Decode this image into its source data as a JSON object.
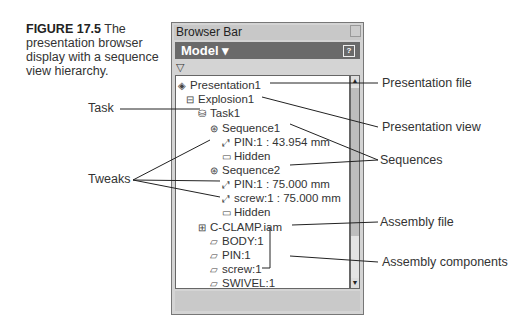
{
  "caption": {
    "figure": "FIGURE 17.5",
    "text": "The presentation browser display with a sequence view hierarchy."
  },
  "panel": {
    "title": "Browser Bar",
    "model_label": "Model ▾",
    "help_icon": "?",
    "filter_icon": "▽",
    "tree": [
      {
        "label": "Presentation1",
        "level": 0,
        "icon": "presentation-icon"
      },
      {
        "label": "Explosion1",
        "level": 1,
        "icon": "explosion-icon"
      },
      {
        "label": "Task1",
        "level": 2,
        "icon": "task-icon"
      },
      {
        "label": "Sequence1",
        "level": 3,
        "icon": "sequence-icon"
      },
      {
        "label": "PIN:1 : 43.954 mm",
        "level": 4,
        "icon": "tweak-icon"
      },
      {
        "label": "Hidden",
        "level": 4,
        "icon": "folder-icon"
      },
      {
        "label": "Sequence2",
        "level": 3,
        "icon": "sequence-icon"
      },
      {
        "label": "PIN:1 : 75.000 mm",
        "level": 4,
        "icon": "tweak-icon"
      },
      {
        "label": "screw:1 : 75.000 mm",
        "level": 4,
        "icon": "tweak-icon"
      },
      {
        "label": "Hidden",
        "level": 4,
        "icon": "folder-icon"
      },
      {
        "label": "C-CLAMP.iam",
        "level": 2,
        "icon": "assembly-icon"
      },
      {
        "label": "BODY:1",
        "level": 3,
        "icon": "part-icon"
      },
      {
        "label": "PIN:1",
        "level": 3,
        "icon": "part-icon"
      },
      {
        "label": "screw:1",
        "level": 3,
        "icon": "part-icon"
      },
      {
        "label": "SWIVEL:1",
        "level": 3,
        "icon": "part-icon"
      }
    ]
  },
  "callouts": {
    "task": "Task",
    "tweaks": "Tweaks",
    "presentation_file": "Presentation file",
    "presentation_view": "Presentation view",
    "sequences": "Sequences",
    "assembly_file": "Assembly file",
    "assembly_components": "Assembly components"
  }
}
